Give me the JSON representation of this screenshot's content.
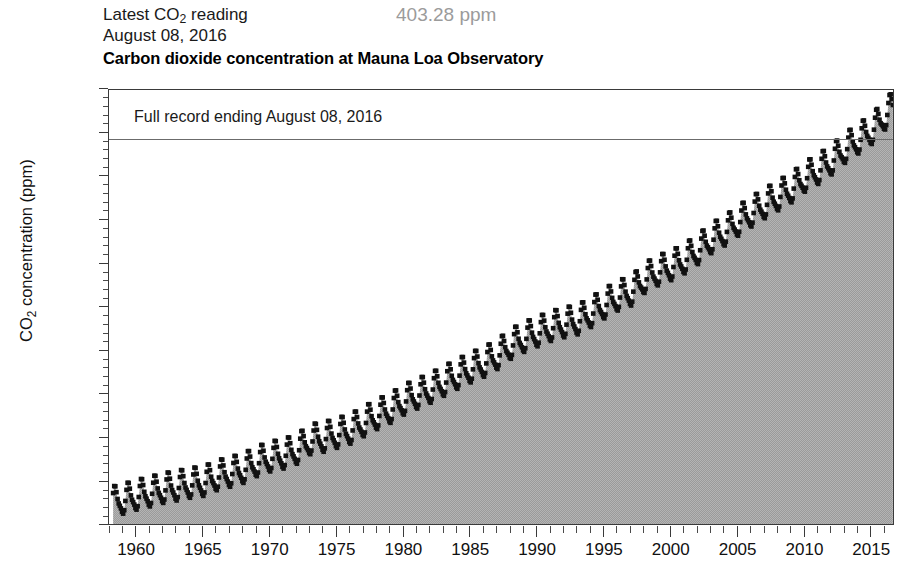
{
  "header": {
    "latest_label_pre": "Latest CO",
    "latest_label_sub": "2",
    "latest_label_post": " reading",
    "latest_label_full": "Latest CO2 reading",
    "latest_date": "August 08, 2016",
    "latest_value": "403.28 ppm",
    "latest_value_number": 403.28,
    "latest_value_units": "ppm",
    "value_color": "#9b9b9b",
    "title_pre": "Carbon dioxide concentration at Mauna Loa Observatory",
    "title": "Carbon dioxide concentration at Mauna Loa Observatory"
  },
  "annotation": {
    "text": "Full record ending August 08, 2016",
    "gridline_value": 400
  },
  "axes": {
    "ylabel_pre": "CO",
    "ylabel_sub": "2",
    "ylabel_post": " concentration (ppm)",
    "ylabel_full": "CO2 concentration (ppm)",
    "xlabel": "",
    "ytick_labels": [
      "410",
      "400",
      "390",
      "380",
      "370",
      "360",
      "350",
      "340",
      "330",
      "320",
      "310"
    ],
    "xtick_labels": [
      "1960",
      "1965",
      "1970",
      "1975",
      "1980",
      "1985",
      "1990",
      "1995",
      "2000",
      "2005",
      "2010",
      "2015"
    ]
  },
  "style": {
    "marker_color": "#111111",
    "fill_color": "#a9a9a9",
    "axis_color": "#3a3a3a",
    "gridline_color": "#6b6b6b",
    "background": "#ffffff"
  },
  "chart_data": {
    "type": "scatter",
    "title": "Carbon dioxide concentration at Mauna Loa Observatory",
    "subtitle": "Full record ending August 08, 2016",
    "xlabel": "",
    "ylabel": "CO2 concentration (ppm)",
    "xlim": [
      1957.9,
      2016.7
    ],
    "ylim": [
      310,
      410
    ],
    "yticks": [
      310,
      320,
      330,
      340,
      350,
      360,
      370,
      380,
      390,
      400,
      410
    ],
    "ytick_minor_step": 2,
    "xticks": [
      1960,
      1965,
      1970,
      1975,
      1980,
      1985,
      1990,
      1995,
      2000,
      2005,
      2010,
      2015
    ],
    "xtick_minor_step": 1,
    "grid": false,
    "legend": null,
    "annotations": [
      {
        "text": "Full record ending August 08, 2016",
        "x": 1959.8,
        "y": 405.5
      },
      {
        "type": "hline",
        "y": 400,
        "label": "400 ppm reference line"
      }
    ],
    "series_name": "Monthly mean CO2 (ppm)",
    "marker": "square",
    "fill_below": true,
    "seasonal_amplitude_ppm": 6.2,
    "annual_means": {
      "x": [
        1958,
        1959,
        1960,
        1961,
        1962,
        1963,
        1964,
        1965,
        1966,
        1967,
        1968,
        1969,
        1970,
        1971,
        1972,
        1973,
        1974,
        1975,
        1976,
        1977,
        1978,
        1979,
        1980,
        1981,
        1982,
        1983,
        1984,
        1985,
        1986,
        1987,
        1988,
        1989,
        1990,
        1991,
        1992,
        1993,
        1994,
        1995,
        1996,
        1997,
        1998,
        1999,
        2000,
        2001,
        2002,
        2003,
        2004,
        2005,
        2006,
        2007,
        2008,
        2009,
        2010,
        2011,
        2012,
        2013,
        2014,
        2015,
        2016
      ],
      "y": [
        315.3,
        315.98,
        316.91,
        317.64,
        318.45,
        318.99,
        319.62,
        320.04,
        321.38,
        322.16,
        323.04,
        324.62,
        325.68,
        326.32,
        327.45,
        329.68,
        330.17,
        331.08,
        332.05,
        333.78,
        335.41,
        336.84,
        338.75,
        340.11,
        341.45,
        343.05,
        344.65,
        346.12,
        347.42,
        349.19,
        351.57,
        353.12,
        354.39,
        355.61,
        356.45,
        357.1,
        358.83,
        360.82,
        362.61,
        363.73,
        366.7,
        368.38,
        369.55,
        371.14,
        373.28,
        375.8,
        377.52,
        379.8,
        381.9,
        383.79,
        385.6,
        387.43,
        389.9,
        391.65,
        393.85,
        396.52,
        398.65,
        400.83,
        404.2
      ]
    }
  }
}
